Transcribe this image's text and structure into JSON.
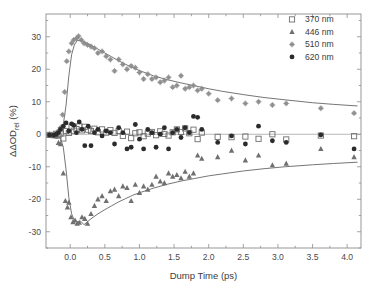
{
  "chart_data": {
    "type": "scatter",
    "title": "",
    "xlabel": "Dump Time (ps)",
    "ylabel": "ΔΔOD",
    "ylabel_sub": "rel",
    "ylabel_unit": " (%)",
    "xlim": [
      -0.35,
      4.2
    ],
    "ylim": [
      -35,
      37
    ],
    "xticks": [
      0.0,
      0.5,
      1.0,
      1.5,
      2.0,
      2.5,
      3.0,
      3.5,
      4.0
    ],
    "xticklabels": [
      "0.0",
      "0.5",
      "1.0",
      "1.5",
      "2.0",
      "2.5",
      "3.0",
      "3.5",
      "4.0"
    ],
    "yticks": [
      30,
      20,
      10,
      0,
      -10,
      -20,
      -30
    ],
    "yticklabels": [
      "30",
      "20",
      "10",
      "0",
      "-10",
      "-20",
      "-30"
    ],
    "grid": false,
    "legend_position": "top-right",
    "legend": [
      {
        "label": "370 nm",
        "marker": "open-square",
        "color": "#6e6e6e"
      },
      {
        "label": "446 nm",
        "marker": "filled-triangle",
        "color": "#707070"
      },
      {
        "label": "510 nm",
        "marker": "star-circle",
        "color": "#8a8a8a"
      },
      {
        "label": "620 nm",
        "marker": "filled-circle",
        "color": "#2b2b2b"
      }
    ],
    "series": [
      {
        "name": "370 nm",
        "marker": "open-square",
        "color": "#6e6e6e",
        "points": [
          [
            -0.3,
            -0.2
          ],
          [
            -0.24,
            -0.3
          ],
          [
            -0.2,
            0.1
          ],
          [
            -0.17,
            -0.4
          ],
          [
            -0.14,
            0.2
          ],
          [
            -0.1,
            -1.3
          ],
          [
            -0.06,
            1.0
          ],
          [
            -0.02,
            0.4
          ],
          [
            0.02,
            2.2
          ],
          [
            0.05,
            1.1
          ],
          [
            0.09,
            1.6
          ],
          [
            0.13,
            2.4
          ],
          [
            0.17,
            1.2
          ],
          [
            0.21,
            2.3
          ],
          [
            0.26,
            1.4
          ],
          [
            0.3,
            1.0
          ],
          [
            0.35,
            1.7
          ],
          [
            0.4,
            0.6
          ],
          [
            0.46,
            1.5
          ],
          [
            0.52,
            0.5
          ],
          [
            0.58,
            1.3
          ],
          [
            0.64,
            0.4
          ],
          [
            0.7,
            1.0
          ],
          [
            0.76,
            -0.5
          ],
          [
            0.82,
            0.8
          ],
          [
            0.88,
            -1.2
          ],
          [
            0.94,
            0.3
          ],
          [
            1.0,
            0.6
          ],
          [
            1.06,
            -0.6
          ],
          [
            1.12,
            0.2
          ],
          [
            1.18,
            0.7
          ],
          [
            1.24,
            -0.3
          ],
          [
            1.3,
            0.9
          ],
          [
            1.36,
            0.1
          ],
          [
            1.42,
            -0.4
          ],
          [
            1.48,
            0.6
          ],
          [
            1.54,
            1.5
          ],
          [
            1.6,
            0.7
          ],
          [
            1.66,
            1.8
          ],
          [
            1.72,
            0.3
          ],
          [
            1.78,
            1.4
          ],
          [
            1.84,
            -1.5
          ],
          [
            1.9,
            0.5
          ],
          [
            2.13,
            -0.8
          ],
          [
            2.33,
            -0.9
          ],
          [
            2.53,
            -0.7
          ],
          [
            2.72,
            -1.4
          ],
          [
            2.92,
            0.0
          ],
          [
            3.12,
            -1.6
          ],
          [
            3.62,
            -0.4
          ],
          [
            4.1,
            -0.6
          ]
        ]
      },
      {
        "name": "446 nm",
        "marker": "filled-triangle",
        "color": "#707070",
        "points": [
          [
            -0.3,
            -0.3
          ],
          [
            -0.24,
            -0.4
          ],
          [
            -0.2,
            -0.6
          ],
          [
            -0.17,
            -2.6
          ],
          [
            -0.14,
            -3.0
          ],
          [
            -0.1,
            -12.0
          ],
          [
            -0.07,
            -20.5
          ],
          [
            -0.04,
            -22.5
          ],
          [
            -0.02,
            -21.0
          ],
          [
            0.01,
            -25.5
          ],
          [
            0.04,
            -27.0
          ],
          [
            0.07,
            -26.5
          ],
          [
            0.1,
            -27.5
          ],
          [
            0.13,
            -27.2
          ],
          [
            0.17,
            -25.5
          ],
          [
            0.21,
            -26.0
          ],
          [
            0.25,
            -27.5
          ],
          [
            0.3,
            -24.5
          ],
          [
            0.35,
            -22.0
          ],
          [
            0.4,
            -20.0
          ],
          [
            0.46,
            -19.0
          ],
          [
            0.52,
            -20.5
          ],
          [
            0.58,
            -17.5
          ],
          [
            0.64,
            -17.0
          ],
          [
            0.7,
            -19.0
          ],
          [
            0.76,
            -16.0
          ],
          [
            0.82,
            -16.5
          ],
          [
            0.88,
            -20.5
          ],
          [
            0.94,
            -15.5
          ],
          [
            1.0,
            -18.0
          ],
          [
            1.06,
            -16.0
          ],
          [
            1.12,
            -17.0
          ],
          [
            1.18,
            -15.5
          ],
          [
            1.24,
            -13.0
          ],
          [
            1.3,
            -14.5
          ],
          [
            1.36,
            -15.0
          ],
          [
            1.42,
            -12.0
          ],
          [
            1.48,
            -13.0
          ],
          [
            1.54,
            -12.5
          ],
          [
            1.6,
            -13.5
          ],
          [
            1.66,
            -11.5
          ],
          [
            1.72,
            -13.0
          ],
          [
            1.78,
            -12.0
          ],
          [
            1.84,
            -6.5
          ],
          [
            1.9,
            -7.5
          ],
          [
            2.13,
            -7.0
          ],
          [
            2.33,
            -5.0
          ],
          [
            2.53,
            -8.0
          ],
          [
            2.72,
            -6.5
          ],
          [
            2.92,
            -9.5
          ],
          [
            3.12,
            -9.0
          ],
          [
            3.62,
            -4.5
          ],
          [
            4.1,
            -7.0
          ]
        ]
      },
      {
        "name": "510 nm",
        "marker": "star-circle",
        "color": "#8a8a8a",
        "points": [
          [
            -0.3,
            0.0
          ],
          [
            -0.24,
            0.2
          ],
          [
            -0.2,
            0.4
          ],
          [
            -0.17,
            1.0
          ],
          [
            -0.14,
            2.0
          ],
          [
            -0.11,
            6.0
          ],
          [
            -0.08,
            13.0
          ],
          [
            -0.05,
            22.5
          ],
          [
            -0.02,
            25.5
          ],
          [
            0.02,
            28.0
          ],
          [
            0.05,
            29.0
          ],
          [
            0.09,
            29.5
          ],
          [
            0.12,
            30.2
          ],
          [
            0.16,
            29.0
          ],
          [
            0.2,
            28.0
          ],
          [
            0.25,
            27.5
          ],
          [
            0.3,
            27.0
          ],
          [
            0.35,
            26.5
          ],
          [
            0.4,
            25.0
          ],
          [
            0.46,
            25.5
          ],
          [
            0.52,
            24.0
          ],
          [
            0.58,
            23.0
          ],
          [
            0.64,
            19.5
          ],
          [
            0.7,
            23.0
          ],
          [
            0.76,
            21.5
          ],
          [
            0.82,
            20.0
          ],
          [
            0.88,
            21.0
          ],
          [
            0.94,
            20.5
          ],
          [
            1.0,
            19.0
          ],
          [
            1.06,
            17.0
          ],
          [
            1.12,
            18.5
          ],
          [
            1.18,
            17.0
          ],
          [
            1.24,
            17.5
          ],
          [
            1.3,
            16.0
          ],
          [
            1.36,
            16.5
          ],
          [
            1.42,
            17.5
          ],
          [
            1.48,
            14.5
          ],
          [
            1.54,
            15.0
          ],
          [
            1.6,
            18.0
          ],
          [
            1.66,
            14.0
          ],
          [
            1.72,
            14.5
          ],
          [
            1.78,
            15.0
          ],
          [
            1.84,
            13.5
          ],
          [
            1.9,
            14.0
          ],
          [
            2.0,
            12.5
          ],
          [
            2.13,
            10.5
          ],
          [
            2.33,
            11.0
          ],
          [
            2.53,
            9.5
          ],
          [
            2.72,
            10.0
          ],
          [
            2.92,
            9.0
          ],
          [
            3.12,
            9.5
          ],
          [
            3.62,
            8.0
          ],
          [
            4.1,
            6.5
          ]
        ]
      },
      {
        "name": "620 nm",
        "marker": "filled-circle",
        "color": "#2b2b2b",
        "points": [
          [
            -0.3,
            -0.2
          ],
          [
            -0.24,
            -0.3
          ],
          [
            -0.2,
            0.0
          ],
          [
            -0.17,
            0.5
          ],
          [
            -0.14,
            1.5
          ],
          [
            -0.1,
            2.5
          ],
          [
            -0.06,
            3.5
          ],
          [
            -0.02,
            1.0
          ],
          [
            0.02,
            3.2
          ],
          [
            0.05,
            2.8
          ],
          [
            0.09,
            0.5
          ],
          [
            0.13,
            3.8
          ],
          [
            0.17,
            1.5
          ],
          [
            0.21,
            -3.5
          ],
          [
            0.26,
            2.5
          ],
          [
            0.3,
            -3.5
          ],
          [
            0.35,
            0.5
          ],
          [
            0.4,
            1.5
          ],
          [
            0.46,
            -0.5
          ],
          [
            0.52,
            1.0
          ],
          [
            0.58,
            0.5
          ],
          [
            0.64,
            -3.0
          ],
          [
            0.7,
            2.0
          ],
          [
            0.76,
            0.5
          ],
          [
            0.82,
            -4.5
          ],
          [
            0.88,
            -4.0
          ],
          [
            0.94,
            3.0
          ],
          [
            1.0,
            -1.5
          ],
          [
            1.06,
            -4.5
          ],
          [
            1.12,
            1.5
          ],
          [
            1.18,
            0.5
          ],
          [
            1.24,
            -4.0
          ],
          [
            1.3,
            0.0
          ],
          [
            1.36,
            2.0
          ],
          [
            1.42,
            -4.5
          ],
          [
            1.48,
            0.5
          ],
          [
            1.54,
            1.5
          ],
          [
            1.6,
            -1.0
          ],
          [
            1.66,
            2.0
          ],
          [
            1.72,
            0.5
          ],
          [
            1.78,
            5.5
          ],
          [
            1.84,
            5.2
          ],
          [
            1.9,
            1.5
          ],
          [
            2.13,
            -2.5
          ],
          [
            2.33,
            -0.5
          ],
          [
            2.53,
            -3.0
          ],
          [
            2.72,
            2.5
          ],
          [
            2.92,
            -2.0
          ],
          [
            3.12,
            -2.5
          ],
          [
            3.62,
            -0.2
          ],
          [
            4.1,
            -4.5
          ]
        ]
      }
    ],
    "fits": [
      {
        "name": "510 nm fit",
        "color": "#5c5c5c",
        "points": [
          [
            -0.32,
            0.0
          ],
          [
            -0.2,
            0.3
          ],
          [
            -0.14,
            1.0
          ],
          [
            -0.1,
            3.0
          ],
          [
            -0.06,
            9.0
          ],
          [
            -0.02,
            18.0
          ],
          [
            0.02,
            24.5
          ],
          [
            0.06,
            27.5
          ],
          [
            0.1,
            28.8
          ],
          [
            0.15,
            28.9
          ],
          [
            0.2,
            28.5
          ],
          [
            0.3,
            27.4
          ],
          [
            0.4,
            26.2
          ],
          [
            0.5,
            25.0
          ],
          [
            0.6,
            23.8
          ],
          [
            0.7,
            22.6
          ],
          [
            0.8,
            21.5
          ],
          [
            0.9,
            20.5
          ],
          [
            1.0,
            19.6
          ],
          [
            1.2,
            18.0
          ],
          [
            1.4,
            16.8
          ],
          [
            1.6,
            15.8
          ],
          [
            1.8,
            14.9
          ],
          [
            2.0,
            14.0
          ],
          [
            2.2,
            13.2
          ],
          [
            2.5,
            12.2
          ],
          [
            2.8,
            11.3
          ],
          [
            3.1,
            10.6
          ],
          [
            3.5,
            9.7
          ],
          [
            3.8,
            9.2
          ],
          [
            4.15,
            8.7
          ]
        ]
      },
      {
        "name": "446 nm fit",
        "color": "#5c5c5c",
        "points": [
          [
            -0.32,
            0.0
          ],
          [
            -0.2,
            -0.4
          ],
          [
            -0.14,
            -1.2
          ],
          [
            -0.1,
            -4.0
          ],
          [
            -0.06,
            -11.0
          ],
          [
            -0.02,
            -19.5
          ],
          [
            0.02,
            -24.5
          ],
          [
            0.06,
            -26.5
          ],
          [
            0.1,
            -27.0
          ],
          [
            0.15,
            -26.8
          ],
          [
            0.2,
            -27.8
          ],
          [
            0.3,
            -26.0
          ],
          [
            0.4,
            -24.5
          ],
          [
            0.5,
            -23.2
          ],
          [
            0.6,
            -22.0
          ],
          [
            0.7,
            -20.8
          ],
          [
            0.8,
            -19.8
          ],
          [
            0.9,
            -18.8
          ],
          [
            1.0,
            -18.0
          ],
          [
            1.2,
            -16.6
          ],
          [
            1.4,
            -15.4
          ],
          [
            1.6,
            -14.4
          ],
          [
            1.8,
            -13.6
          ],
          [
            2.0,
            -12.8
          ],
          [
            2.2,
            -12.2
          ],
          [
            2.5,
            -11.3
          ],
          [
            2.8,
            -10.6
          ],
          [
            3.1,
            -10.0
          ],
          [
            3.5,
            -9.4
          ],
          [
            3.8,
            -9.0
          ],
          [
            4.15,
            -8.6
          ]
        ]
      }
    ]
  }
}
